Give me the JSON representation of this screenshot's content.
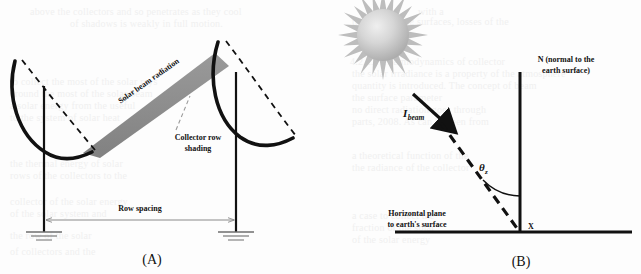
{
  "figure": {
    "background_color": "#fdfdfd",
    "ink_color": "#111111",
    "beam_fill": "#8c8c8c",
    "sun_color": "#b3b3b3",
    "ground_line_color": "#8a8a8a"
  },
  "panel_a": {
    "caption": "(A)",
    "labels": {
      "solar_beam": "Solar beam radiation",
      "collector_shading_line1": "Collector row",
      "collector_shading_line2": "shading",
      "row_spacing": "Row spacing"
    },
    "elements": {
      "left_collector": "parabolic-trough-left",
      "right_collector": "parabolic-trough-right",
      "left_post": "support-post-left",
      "right_post": "support-post-right",
      "left_ground": "ground-symbol-left",
      "right_ground": "ground-symbol-right",
      "beam_band": "solar-beam-band",
      "shading_pointer": "shading-leader-line",
      "spacing_arrow": "row-spacing-dimension-line"
    }
  },
  "panel_b": {
    "caption": "(B)",
    "labels": {
      "normal_line1": "N (normal to the",
      "normal_line2": "earth surface)",
      "beam_symbol": "I",
      "beam_subscript": "beam",
      "angle_symbol": "θ",
      "angle_subscript": "z",
      "horizontal_line1": "Horizontal plane",
      "horizontal_line2": "to earth's surface",
      "origin_point": "X"
    },
    "elements": {
      "sun": "sun-graphic",
      "normal_axis": "normal-vertical-axis",
      "horizon_axis": "horizontal-plane-axis",
      "beam_ray": "incident-beam-dashed-ray",
      "beam_arrow": "incident-beam-arrowhead",
      "zenith_arc": "zenith-angle-arc"
    }
  },
  "ghost_text": [
    {
      "t": "above the collectors and so penetrates as they cool",
      "x": 30,
      "y": 6
    },
    {
      "t": "of shadows is weakly in full motion.",
      "x": 70,
      "y": 18
    },
    {
      "t": "with a",
      "x": 418,
      "y": 6
    },
    {
      "t": "their reflecting surfaces, losses of the",
      "x": 352,
      "y": 16
    },
    {
      "t": "4.2.2.1  Thermodynamics of collector",
      "x": 350,
      "y": 56
    },
    {
      "t": "the solar irradiance is a property of the atmosphere",
      "x": 352,
      "y": 68
    },
    {
      "t": "quantity is introduced.  The concept of beam",
      "x": 352,
      "y": 80
    },
    {
      "t": "the surface parameter",
      "x": 352,
      "y": 92
    },
    {
      "t": "no direct radiation goes through",
      "x": 352,
      "y": 104
    },
    {
      "t": "parts, 2008.  As can be seen from",
      "x": 352,
      "y": 116
    },
    {
      "t": "a theoretical function of the",
      "x": 352,
      "y": 150
    },
    {
      "t": "the radiance of the collector",
      "x": 352,
      "y": 162
    },
    {
      "t": "a case to collect the",
      "x": 352,
      "y": 210
    },
    {
      "t": "fraction of the solar",
      "x": 352,
      "y": 222
    },
    {
      "t": "of the solar energy",
      "x": 352,
      "y": 234
    },
    {
      "t": "to collect the most of the solar rays",
      "x": 10,
      "y": 76
    },
    {
      "t": "around the most of the solar beam",
      "x": 10,
      "y": 88
    },
    {
      "t": "a solar energy from the useful",
      "x": 10,
      "y": 100
    },
    {
      "t": "to the system of solar heat",
      "x": 10,
      "y": 112
    },
    {
      "t": "the thermal energy of solar",
      "x": 10,
      "y": 158
    },
    {
      "t": "rows of the collectors to the",
      "x": 10,
      "y": 170
    },
    {
      "t": "collector of the solar energy",
      "x": 10,
      "y": 196
    },
    {
      "t": "of the solar system and",
      "x": 10,
      "y": 208
    },
    {
      "t": "the row of the solar",
      "x": 10,
      "y": 230
    },
    {
      "t": "of collectors and the",
      "x": 10,
      "y": 246
    }
  ]
}
